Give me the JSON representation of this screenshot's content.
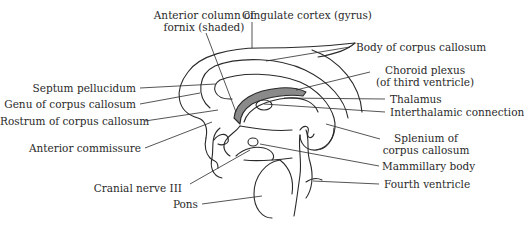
{
  "diagram": {
    "type": "anatomical-sagittal-brain-midline",
    "colors": {
      "line": "#2a2a2a",
      "shade": "#8a8a8a",
      "background": "#ffffff"
    },
    "labels": {
      "anterior_column_fornix_1": "Anterior column of",
      "anterior_column_fornix_2": "fornix (shaded)",
      "cingulate_cortex": "Cingulate cortex (gyrus)",
      "body_corpus_callosum": "Body of corpus callosum",
      "choroid_plexus_1": "Choroid plexus",
      "choroid_plexus_2": "(of third ventricle)",
      "thalamus": "Thalamus",
      "interthalamic_connection": "Interthalamic connection",
      "splenium_1": "Splenium of",
      "splenium_2": "corpus callosum",
      "mammillary_body": "Mammillary body",
      "fourth_ventricle": "Fourth ventricle",
      "septum_pellucidum": "Septum pellucidum",
      "genu_corpus_callosum": "Genu of corpus callosum",
      "rostrum_corpus_callosum": "Rostrum of corpus callosum",
      "anterior_commissure": "Anterior commissure",
      "cranial_nerve_iii": "Cranial nerve III",
      "pons": "Pons"
    }
  }
}
